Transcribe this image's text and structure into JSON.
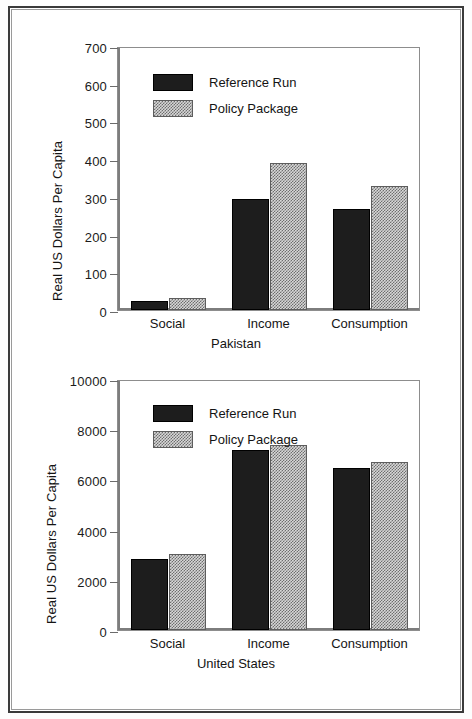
{
  "figure": {
    "ylabel": "Real US Dollars Per Capita",
    "legend": {
      "reference": "Reference Run",
      "policy": "Policy Package"
    }
  },
  "chart_data": [
    {
      "type": "bar",
      "title": "",
      "xlabel": "Pakistan",
      "ylabel": "Real US Dollars Per Capita",
      "categories": [
        "Social",
        "Income",
        "Consumption"
      ],
      "series": [
        {
          "name": "Reference Run",
          "values": [
            24,
            295,
            268
          ]
        },
        {
          "name": "Policy Package",
          "values": [
            31,
            390,
            330
          ]
        }
      ],
      "ylim": [
        0,
        700
      ],
      "yticks": [
        0,
        100,
        200,
        300,
        400,
        500,
        600,
        700
      ],
      "ytick_labels": [
        "0",
        "100",
        "200",
        "300",
        "400",
        "500",
        "600",
        "700"
      ],
      "grid": false,
      "legend_position": "upper-left"
    },
    {
      "type": "bar",
      "title": "",
      "xlabel": "United States",
      "ylabel": "Real US Dollars Per Capita",
      "categories": [
        "Social",
        "Income",
        "Consumption"
      ],
      "series": [
        {
          "name": "Reference Run",
          "values": [
            2820,
            7180,
            6450
          ]
        },
        {
          "name": "Policy Package",
          "values": [
            3020,
            7380,
            6700
          ]
        }
      ],
      "ylim": [
        0,
        10000
      ],
      "yticks": [
        0,
        2000,
        4000,
        6000,
        8000,
        10000
      ],
      "ytick_labels": [
        "0",
        "2000",
        "4000",
        "6000",
        "8000",
        "10000"
      ],
      "grid": false,
      "legend_position": "upper-left"
    }
  ],
  "colors": {
    "reference_run": "#1d1d1d",
    "policy_package": "#b0b0b0",
    "axis": "#7d7d7d",
    "text": "#141414",
    "frame": "#3a3a3a"
  }
}
